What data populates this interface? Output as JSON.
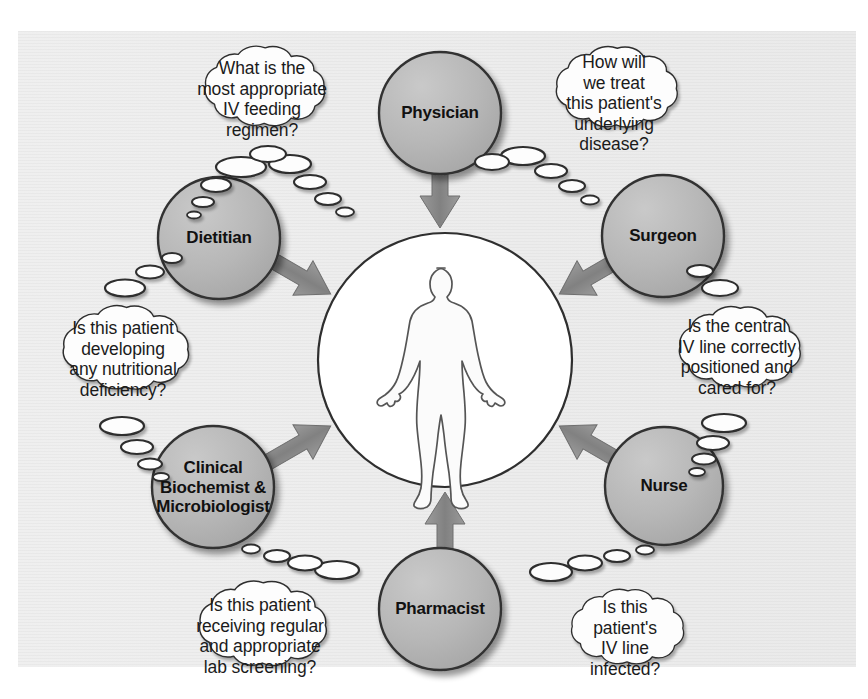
{
  "diagram": {
    "center": {
      "figure_label": "patient-outline"
    },
    "colors": {
      "role_circle_fill": "#b4b4b4",
      "role_circle_stroke": "#3a3a3a",
      "arrow": "#8a8a8a",
      "bubble_fill": "#fdfdfd",
      "bubble_stroke": "#2e2e2e",
      "panel_background": "#eeeeee",
      "text": "#1b1b1b"
    },
    "roles": [
      {
        "id": "physician",
        "label": "Physician",
        "position": "top",
        "label_cx": 440,
        "label_cy": 113
      },
      {
        "id": "surgeon",
        "label": "Surgeon",
        "position": "top-right",
        "label_cx": 663,
        "label_cy": 236
      },
      {
        "id": "nurse",
        "label": "Nurse",
        "position": "bottom-right",
        "label_cx": 664,
        "label_cy": 486
      },
      {
        "id": "pharmacist",
        "label": "Pharmacist",
        "position": "bottom",
        "label_cx": 440,
        "label_cy": 609
      },
      {
        "id": "clinical-biochemist-microbiologist",
        "label": "Clinical\nBiochemist &\nMicrobiologist",
        "position": "bottom-left",
        "label_cx": 213,
        "label_cy": 487
      },
      {
        "id": "dietitian",
        "label": "Dietitian",
        "position": "top-left",
        "label_cx": 219,
        "label_cy": 238
      }
    ],
    "thought_bubbles": [
      {
        "id": "physician-question",
        "owner": "physician",
        "text": "What is the\nmost appropriate\nIV feeding\nregimen?",
        "cx": 261,
        "cy": 98
      },
      {
        "id": "surgeon-question",
        "owner": "surgeon",
        "text": "How will\nwe treat\nthis patient's\nunderlying\ndisease?",
        "cx": 614,
        "cy": 99
      },
      {
        "id": "nurse-line-care-question",
        "owner": "surgeon",
        "text": "Is the central\nIV line correctly\npositioned and\ncared for?",
        "cx": 737,
        "cy": 356
      },
      {
        "id": "nurse-infection-question",
        "owner": "nurse",
        "text": "Is this\npatient's\nIV line\ninfected?",
        "cx": 625,
        "cy": 636
      },
      {
        "id": "pharmacist-lab-question",
        "owner": "clinical-biochemist-microbiologist",
        "text": "Is this patient\nreceiving regular\nand appropriate\nlab screening?",
        "cx": 260,
        "cy": 631
      },
      {
        "id": "dietitian-question",
        "owner": "dietitian",
        "text": "Is this patient\ndeveloping\nany nutritional\ndeficiency?",
        "cx": 122,
        "cy": 358
      }
    ],
    "arrows": [
      {
        "id": "arrow-physician-to-patient",
        "from": "physician",
        "to": "patient"
      },
      {
        "id": "arrow-surgeon-to-patient",
        "from": "surgeon",
        "to": "patient"
      },
      {
        "id": "arrow-nurse-to-patient",
        "from": "nurse",
        "to": "patient"
      },
      {
        "id": "arrow-pharmacist-to-patient",
        "from": "pharmacist",
        "to": "patient"
      },
      {
        "id": "arrow-biochemist-to-patient",
        "from": "clinical-biochemist-microbiologist",
        "to": "patient"
      },
      {
        "id": "arrow-dietitian-to-patient",
        "from": "dietitian",
        "to": "patient"
      }
    ]
  }
}
